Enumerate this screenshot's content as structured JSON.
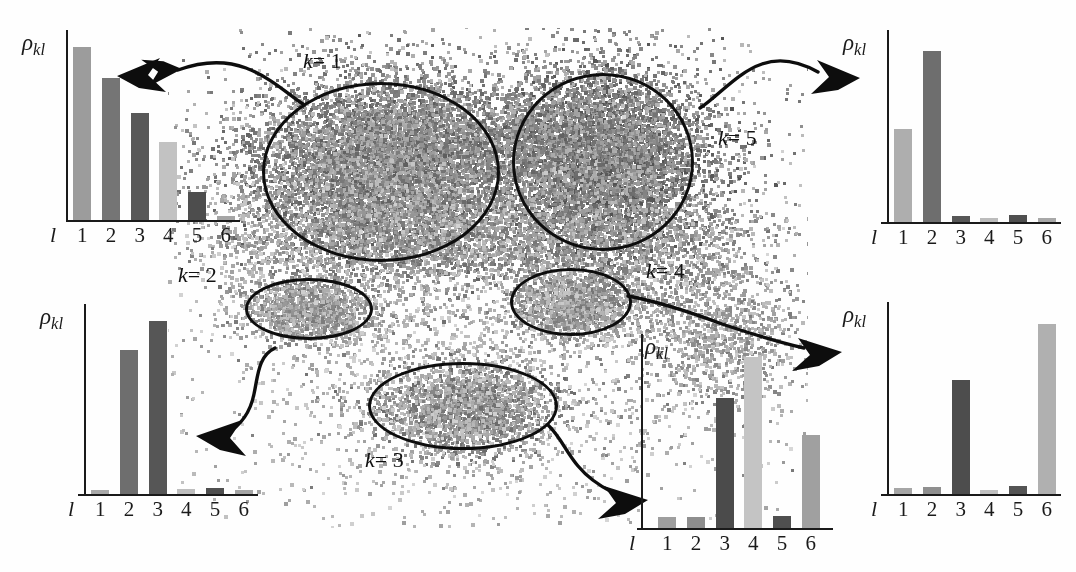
{
  "figure": {
    "title": "",
    "axis_symbol_rho": "ρ",
    "axis_symbol_rho_sub": "kl",
    "axis_symbol_l": "l",
    "tick_labels": [
      "1",
      "2",
      "3",
      "4",
      "5",
      "6"
    ],
    "cluster_labels": [
      {
        "id": "k1",
        "text": "k = 1",
        "k": "k",
        "eq": "= 1"
      },
      {
        "id": "k2",
        "text": "k = 2",
        "k": "k",
        "eq": "= 2"
      },
      {
        "id": "k3",
        "text": "k = 3",
        "k": "k",
        "eq": "= 3"
      },
      {
        "id": "k4",
        "text": "k = 4",
        "k": "k",
        "eq": "= 4"
      },
      {
        "id": "k5",
        "text": "k = 5",
        "k": "k",
        "eq": "= 5"
      }
    ]
  },
  "palette": {
    "bar_light": "#c2c2c2",
    "bar_midlight": "#9c9c9c",
    "bar_mid": "#8a8a8a",
    "bar_middark": "#6f6f6f",
    "bar_dark": "#4f4f4f",
    "axis": "#1a1a1a",
    "outline": "#0d0d0d",
    "background": "#fefefe"
  },
  "chart_data": [
    {
      "id": "chart-k1",
      "type": "bar",
      "title": "",
      "cluster": "k = 1",
      "xlabel": "l",
      "ylabel": "ρkl",
      "categories": [
        "1",
        "2",
        "3",
        "4",
        "5",
        "6"
      ],
      "values": [
        0.97,
        0.8,
        0.6,
        0.44,
        0.16,
        0.025
      ],
      "colors": [
        "#9c9c9c",
        "#757575",
        "#585858",
        "#c2c2c2",
        "#4d4d4d",
        "#a5a5a5"
      ],
      "ylim": [
        0,
        1
      ],
      "grid": false,
      "legend": "none"
    },
    {
      "id": "chart-k5",
      "type": "bar",
      "title": "",
      "cluster": "k = 5",
      "xlabel": "l",
      "ylabel": "ρkl",
      "categories": [
        "1",
        "2",
        "3",
        "4",
        "5",
        "6"
      ],
      "values": [
        0.52,
        0.96,
        0.035,
        0.022,
        0.04,
        0.022
      ],
      "colors": [
        "#aeaeae",
        "#6e6e6e",
        "#575757",
        "#bcbcbc",
        "#4f4f4f",
        "#a8a8a8"
      ],
      "ylim": [
        0,
        1
      ],
      "grid": false,
      "legend": "none"
    },
    {
      "id": "chart-k2",
      "type": "bar",
      "title": "",
      "cluster": "k = 2",
      "xlabel": "l",
      "ylabel": "ρkl",
      "categories": [
        "1",
        "2",
        "3",
        "4",
        "5",
        "6"
      ],
      "values": [
        0.025,
        0.81,
        0.97,
        0.03,
        0.035,
        0.025
      ],
      "colors": [
        "#a8a8a8",
        "#6e6e6e",
        "#565656",
        "#bebebe",
        "#4f4f4f",
        "#a5a5a5"
      ],
      "ylim": [
        0,
        1
      ],
      "grid": false,
      "legend": "none"
    },
    {
      "id": "chart-k3",
      "type": "bar",
      "title": "",
      "cluster": "k = 3",
      "xlabel": "l",
      "ylabel": "ρkl",
      "categories": [
        "1",
        "2",
        "3",
        "4",
        "5",
        "6"
      ],
      "values": [
        0.06,
        0.06,
        0.73,
        0.96,
        0.065,
        0.52
      ],
      "colors": [
        "#9e9e9e",
        "#8e8e8e",
        "#4b4b4b",
        "#c4c4c4",
        "#4f4f4f",
        "#a0a0a0"
      ],
      "ylim": [
        0,
        1
      ],
      "grid": false,
      "legend": "none"
    },
    {
      "id": "chart-k4",
      "type": "bar",
      "title": "",
      "cluster": "k = 4",
      "xlabel": "l",
      "ylabel": "ρkl",
      "categories": [
        "1",
        "2",
        "3",
        "4",
        "5",
        "6"
      ],
      "values": [
        0.035,
        0.04,
        0.64,
        0.025,
        0.045,
        0.955
      ],
      "colors": [
        "#a6a6a6",
        "#8f8f8f",
        "#4d4d4d",
        "#c0c0c0",
        "#545454",
        "#b0b0b0"
      ],
      "ylim": [
        0,
        1
      ],
      "grid": false,
      "legend": "none"
    }
  ]
}
